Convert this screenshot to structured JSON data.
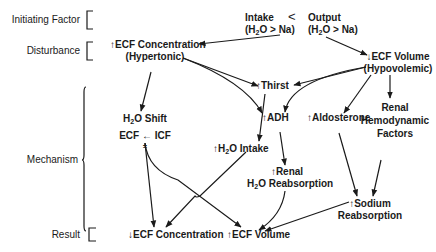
{
  "stages": {
    "initiating": "Initiating Factor",
    "disturbance": "Disturbance",
    "mechanism": "Mechanism",
    "result": "Result"
  },
  "nodes": {
    "intake": {
      "line1": "Intake",
      "line2": "(H2O > Na)"
    },
    "less_than": "<",
    "output": {
      "line1": "Output",
      "line2": "(H2O > Na)"
    },
    "ecf_conc_up": {
      "line1": "↑ECF Concentration",
      "line2": "(Hypertonic)"
    },
    "ecf_vol_down": {
      "line1": "↓ECF Volume",
      "line2": "(Hypovolemic)"
    },
    "thirst": "↑Thirst",
    "adh": "↑ADH",
    "aldosterone": "↑Aldosterone",
    "renal_hemo": {
      "line1": "Renal",
      "line2": "Hemodynamic",
      "line3": "Factors"
    },
    "h2o_shift": {
      "line1": "H2O Shift",
      "line2": "ECF ← ICF",
      "line3": "±"
    },
    "h2o_intake": "↑H2O Intake",
    "renal_h2o": {
      "line1": "↑Renal",
      "line2": "H2O Reabsorption"
    },
    "sodium": {
      "line1": "↑Sodium",
      "line2": "Reabsorption"
    },
    "ecf_conc_down": "↓ECF Concentration",
    "ecf_vol_up": "↑ECF Volume"
  },
  "colors": {
    "ink": "#1a1a1a",
    "background": "#ffffff"
  }
}
